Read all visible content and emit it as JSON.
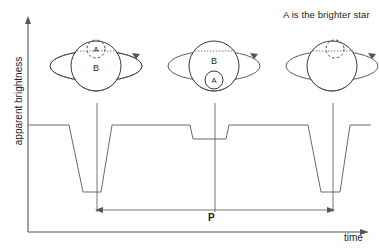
{
  "figure": {
    "title_note": "A is the brighter star",
    "axes": {
      "x_label": "time",
      "y_label": "apparent brightness"
    },
    "period": {
      "label": "P",
      "start_x": 97,
      "end_x": 333,
      "y": 210
    }
  },
  "panels": [
    {
      "name": "panel-secondary-eclipse-left",
      "center_x": 96,
      "center_y": 66,
      "star_B_label": "B",
      "star_A_label": "A",
      "star_A_state": "behind-dashed",
      "star_A_offset_x": 0,
      "star_A_offset_y": -17,
      "tick_x": 97
    },
    {
      "name": "panel-primary-eclipse-middle",
      "center_x": 214,
      "center_y": 66,
      "star_B_label": "B",
      "star_A_label": "A",
      "star_A_state": "front-solid",
      "star_A_offset_x": 0,
      "star_A_offset_y": 14,
      "tick_x": 215
    },
    {
      "name": "panel-secondary-eclipse-right",
      "center_x": 332,
      "center_y": 66,
      "star_B_label": "",
      "star_A_label": "",
      "star_A_state": "behind-dashed",
      "star_A_offset_x": 3,
      "star_A_offset_y": -17,
      "tick_x": 333
    }
  ],
  "chart_data": {
    "type": "line",
    "title": "",
    "xlabel": "time",
    "ylabel": "apparent brightness",
    "annotations": [
      "A is the brighter star",
      "P"
    ],
    "grid": false,
    "legend": null,
    "series": [
      {
        "name": "apparent brightness light curve",
        "description": "Eclipsing binary light curve: flat baseline interrupted by alternating deep (primary) and shallow (secondary) eclipses.",
        "points_px": [
          [
            28,
            125
          ],
          [
            69,
            125
          ],
          [
            83,
            192
          ],
          [
            101,
            192
          ],
          [
            112,
            125
          ],
          [
            190,
            125
          ],
          [
            193,
            139
          ],
          [
            226,
            139
          ],
          [
            229,
            125
          ],
          [
            308,
            125
          ],
          [
            321,
            192
          ],
          [
            340,
            192
          ],
          [
            350,
            125
          ],
          [
            371,
            125
          ]
        ],
        "baseline_y_px": 125,
        "deep_min_y_px": 192,
        "shallow_min_y_px": 139
      }
    ],
    "events": [
      {
        "type": "deep-eclipse",
        "center_x_px": 97,
        "depth": "deep",
        "cause": "A (brighter) hidden behind B"
      },
      {
        "type": "shallow-eclipse",
        "center_x_px": 215,
        "depth": "shallow",
        "cause": "A (brighter) in front of B"
      },
      {
        "type": "deep-eclipse",
        "center_x_px": 333,
        "depth": "deep",
        "cause": "A (brighter) hidden behind B"
      }
    ],
    "axis_origin_px": [
      28,
      232
    ],
    "x_axis_end_px": [
      368,
      232
    ],
    "y_axis_top_px": [
      28,
      18
    ]
  }
}
